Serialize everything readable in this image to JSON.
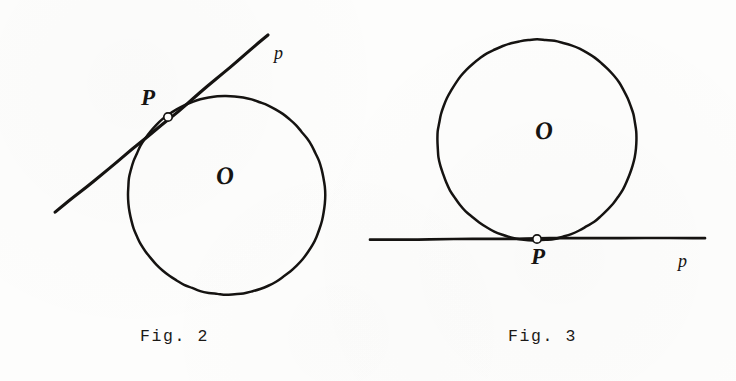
{
  "page": {
    "background_color": "#fdfdfc",
    "ink_color": "#151311",
    "width": 736,
    "height": 381
  },
  "figures": [
    {
      "id": "fig-2",
      "caption": "Fig. 2",
      "caption_x": 140,
      "caption_y": 327,
      "circle": {
        "cx": 226,
        "cy": 195,
        "r": 99
      },
      "center_label": {
        "text": "O",
        "x": 216,
        "y": 163
      },
      "tangent_line": {
        "x1": 55,
        "y1": 212,
        "x2": 268,
        "y2": 35
      },
      "tangency_point": {
        "x": 168,
        "y": 117,
        "r": 4.2
      },
      "point_label": {
        "text": "P",
        "x": 141,
        "y": 86
      },
      "line_label": {
        "text": "p",
        "x": 274,
        "y": 44
      }
    },
    {
      "id": "fig-3",
      "caption": "Fig. 3",
      "caption_x": 508,
      "caption_y": 327,
      "circle": {
        "cx": 537,
        "cy": 140,
        "r": 100
      },
      "center_label": {
        "text": "O",
        "x": 535,
        "y": 118
      },
      "tangent_line": {
        "x1": 370,
        "y1": 240,
        "x2": 705,
        "y2": 238
      },
      "tangency_point": {
        "x": 537,
        "y": 239,
        "r": 4.2
      },
      "point_label": {
        "text": "P",
        "x": 531,
        "y": 245
      },
      "line_label": {
        "text": "p",
        "x": 678,
        "y": 252
      }
    }
  ]
}
